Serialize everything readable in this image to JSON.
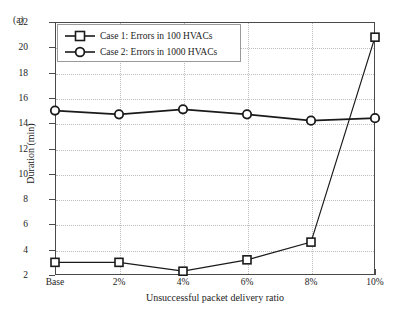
{
  "figure": {
    "panel_label": "(a)",
    "background_color": "#ffffff",
    "line_color": "#1a1a1a",
    "grid_color": "#bdbdbd"
  },
  "legend": {
    "position": "top-left-inside",
    "entries": [
      {
        "label": "Case 1: Errors in 100 HVACs",
        "marker": "square"
      },
      {
        "label": "Case 2: Errors in 1000 HVACs",
        "marker": "circle"
      }
    ]
  },
  "axes": {
    "ylabel": "Duration (min)",
    "xlabel": "Unsuccessful packet delivery ratio",
    "ytick_labels": [
      "22",
      "20",
      "18",
      "16",
      "14",
      "12",
      "10",
      "8",
      "6",
      "4",
      "2"
    ],
    "xtick_labels": [
      "Base",
      "2%",
      "4%",
      "6%",
      "8%",
      "10%"
    ]
  },
  "chart_data": {
    "type": "line",
    "title": "",
    "subtitle": "",
    "xlabel": "Unsuccessful packet delivery ratio",
    "ylabel": "Duration (min)",
    "categories": [
      "Base",
      "2%",
      "4%",
      "6%",
      "8%",
      "10%"
    ],
    "ylim": [
      2,
      22
    ],
    "yticks": [
      2,
      4,
      6,
      8,
      10,
      12,
      14,
      16,
      18,
      20,
      22
    ],
    "grid": true,
    "legend_position": "upper left",
    "series": [
      {
        "name": "Case 1: Errors in 100 HVACs",
        "marker": "square",
        "color": "#1a1a1a",
        "values": [
          3.0,
          3.0,
          2.3,
          3.2,
          4.6,
          20.8
        ]
      },
      {
        "name": "Case 2: Errors in 1000 HVACs",
        "marker": "circle",
        "color": "#1a1a1a",
        "values": [
          15.0,
          14.7,
          15.1,
          14.7,
          14.2,
          14.4
        ]
      }
    ],
    "annotations": [
      "(a)"
    ]
  }
}
